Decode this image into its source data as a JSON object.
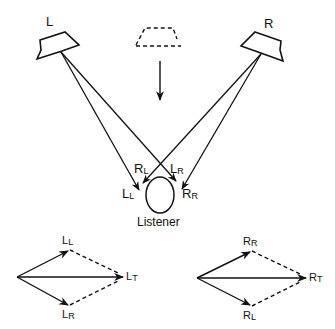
{
  "diagram": {
    "speakers": {
      "left_label": "L",
      "right_label": "R"
    },
    "listener_label": "Listener",
    "path_labels": {
      "rl_main": "R",
      "rl_main_sub": "L",
      "lr_main": "L",
      "lr_main_sub": "R",
      "ll_main": "L",
      "ll_main_sub": "L",
      "rr_main": "R",
      "rr_main_sub": "R"
    },
    "left_vector_diagram": {
      "top": "L",
      "top_sub": "L",
      "bottom": "L",
      "bottom_sub": "R",
      "result": "L",
      "result_sub": "T"
    },
    "right_vector_diagram": {
      "top": "R",
      "top_sub": "R",
      "bottom": "R",
      "bottom_sub": "L",
      "result": "R",
      "result_sub": "T"
    },
    "colors": {
      "ink": "#111111",
      "background": "#ffffff"
    }
  }
}
